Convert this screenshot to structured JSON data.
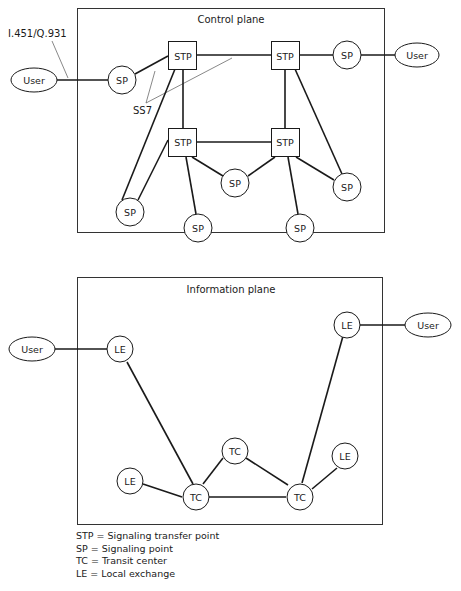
{
  "control_plane": {
    "title": "Control plane",
    "interface_label": "I.451/Q.931",
    "ss7_label": "SS7",
    "nodes": {
      "user_left": "User",
      "user_right": "User",
      "sp_left": "SP",
      "sp_right": "SP",
      "stp_tl": "STP",
      "stp_tr": "STP",
      "stp_bl": "STP",
      "stp_br": "STP",
      "sp_mid": "SP",
      "sp_br_right": "SP",
      "sp_far_left": "SP",
      "sp_bottom_left": "SP",
      "sp_bottom_right": "SP"
    }
  },
  "information_plane": {
    "title": "Information plane",
    "nodes": {
      "user_left": "User",
      "user_right": "User",
      "le_left": "LE",
      "le_top_right": "LE",
      "le_bottom_left": "LE",
      "le_bottom_right": "LE",
      "tc_top": "TC",
      "tc_left": "TC",
      "tc_right": "TC"
    }
  },
  "legend": [
    "STP = Signaling transfer point",
    "SP = Signaling point",
    "TC = Transit center",
    "LE = Local exchange"
  ]
}
